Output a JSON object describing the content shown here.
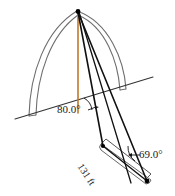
{
  "figure": {
    "type": "geometry-diagram",
    "width": 175,
    "height": 196,
    "background_color": "#ffffff"
  },
  "labels": {
    "angle_top": "80.0°",
    "angle_bottom": "69.0°",
    "distance": "131 ft"
  },
  "colors": {
    "arch_outline": "#6e6e6e",
    "sight_lines": "#111111",
    "ground_line": "#333333",
    "height_line": "#c07a2a",
    "road_outline": "#555555",
    "text": "#1a1a1a",
    "marker_fill": "#000000"
  },
  "geometry": {
    "apex": {
      "x": 78,
      "y": 11
    },
    "ground_line": {
      "x1": 15,
      "y1": 119,
      "x2": 153,
      "y2": 77
    },
    "height_line": {
      "x1": 78,
      "y1": 12,
      "x2": 78,
      "y2": 113
    },
    "near_point": {
      "x": 103,
      "y": 146
    },
    "far_point": {
      "x": 147,
      "y": 181
    },
    "base_point": {
      "x": 78,
      "y": 113
    },
    "arch_left_base": {
      "x": 31,
      "y": 116
    },
    "arch_right_base": {
      "x": 125,
      "y": 88
    },
    "road_length_label_angle_deg": 57
  },
  "elements": {
    "arch_outer_curve": "outer-arch-curve",
    "arch_inner_curve": "inner-arch-curve",
    "vertical_height_segment": "arch-height-segment",
    "angle_arc_top": "angle-arc-80",
    "angle_arc_bottom": "angle-arc-69",
    "road_strip": "road-strip",
    "sight_line_near": "sight-line-to-near-point",
    "sight_line_far": "sight-line-to-far-point"
  }
}
